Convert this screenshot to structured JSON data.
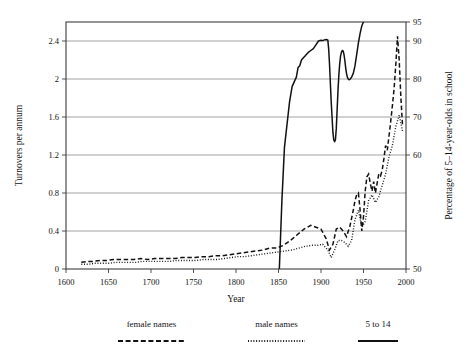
{
  "chart_data": {
    "type": "line",
    "title": "",
    "subtitle": "",
    "xlabel": "Year",
    "ylabel": "Turnovers per annum",
    "y2label": "Percentage of 5–14-year-olds in school",
    "xlim": [
      1600,
      2000
    ],
    "ylim": [
      0,
      2.6
    ],
    "y2lim": [
      50,
      95
    ],
    "xticks": [
      "1600",
      "1650",
      "1700",
      "1750",
      "1800",
      "1850",
      "1900",
      "1950",
      "2000"
    ],
    "xtick_values": [
      1600,
      1650,
      1700,
      1750,
      1800,
      1850,
      1900,
      1950,
      2000
    ],
    "yticks": [
      "0",
      "0.4",
      "0.8",
      "1.2",
      "1.6",
      "2",
      "2.4"
    ],
    "ytick_values": [
      0,
      0.4,
      0.8,
      1.2,
      1.6,
      2,
      2.4
    ],
    "y2ticks": [
      "50",
      "60",
      "70",
      "80",
      "90",
      "95"
    ],
    "y2tick_values": [
      50,
      60,
      70,
      80,
      90,
      95
    ],
    "grid": true,
    "grid_axis": "y",
    "legend_position": "below-outside",
    "legend": [
      "female names",
      "male names",
      "5 to 14"
    ],
    "series": [
      {
        "name": "female names",
        "style": "dashed",
        "axis": "left",
        "x": [
          1618,
          1625,
          1632,
          1640,
          1648,
          1656,
          1664,
          1672,
          1680,
          1688,
          1696,
          1704,
          1712,
          1720,
          1728,
          1736,
          1744,
          1752,
          1760,
          1768,
          1776,
          1784,
          1792,
          1800,
          1808,
          1816,
          1824,
          1832,
          1840,
          1848,
          1856,
          1864,
          1872,
          1880,
          1888,
          1894,
          1900,
          1906,
          1910,
          1914,
          1918,
          1922,
          1926,
          1930,
          1934,
          1938,
          1940,
          1942,
          1944,
          1946,
          1948,
          1950,
          1952,
          1954,
          1956,
          1958,
          1960,
          1962,
          1964,
          1966,
          1968,
          1970,
          1972,
          1974,
          1976,
          1978,
          1980,
          1982,
          1984,
          1986,
          1988,
          1990,
          1992,
          1994,
          1996
        ],
        "y": [
          0.07,
          0.08,
          0.08,
          0.09,
          0.09,
          0.1,
          0.1,
          0.1,
          0.1,
          0.11,
          0.1,
          0.11,
          0.11,
          0.11,
          0.11,
          0.12,
          0.12,
          0.12,
          0.13,
          0.13,
          0.14,
          0.14,
          0.15,
          0.16,
          0.17,
          0.18,
          0.19,
          0.2,
          0.22,
          0.22,
          0.25,
          0.3,
          0.36,
          0.42,
          0.46,
          0.44,
          0.42,
          0.32,
          0.2,
          0.26,
          0.42,
          0.44,
          0.4,
          0.34,
          0.45,
          0.62,
          0.72,
          0.78,
          0.8,
          0.62,
          0.4,
          0.55,
          0.82,
          0.97,
          1.0,
          0.9,
          0.82,
          0.92,
          0.8,
          0.9,
          1.0,
          0.98,
          1.04,
          1.16,
          1.3,
          1.25,
          1.4,
          1.55,
          1.72,
          1.9,
          2.15,
          2.45,
          2.2,
          1.8,
          1.5
        ]
      },
      {
        "name": "male names",
        "style": "dotted",
        "axis": "left",
        "x": [
          1618,
          1626,
          1634,
          1642,
          1650,
          1658,
          1666,
          1674,
          1682,
          1690,
          1698,
          1706,
          1714,
          1722,
          1730,
          1738,
          1746,
          1754,
          1762,
          1770,
          1778,
          1786,
          1794,
          1802,
          1810,
          1818,
          1826,
          1834,
          1842,
          1850,
          1858,
          1866,
          1874,
          1882,
          1890,
          1896,
          1902,
          1908,
          1912,
          1916,
          1920,
          1924,
          1928,
          1932,
          1936,
          1940,
          1944,
          1948,
          1952,
          1956,
          1960,
          1964,
          1968,
          1972,
          1976,
          1980,
          1984,
          1988,
          1992,
          1996
        ],
        "y": [
          0.05,
          0.05,
          0.06,
          0.06,
          0.06,
          0.07,
          0.07,
          0.07,
          0.07,
          0.08,
          0.08,
          0.08,
          0.08,
          0.08,
          0.09,
          0.09,
          0.09,
          0.09,
          0.1,
          0.1,
          0.1,
          0.11,
          0.12,
          0.13,
          0.13,
          0.14,
          0.15,
          0.16,
          0.17,
          0.18,
          0.19,
          0.2,
          0.22,
          0.24,
          0.25,
          0.25,
          0.26,
          0.2,
          0.12,
          0.2,
          0.3,
          0.3,
          0.28,
          0.24,
          0.3,
          0.52,
          0.62,
          0.44,
          0.5,
          0.72,
          0.78,
          0.7,
          0.76,
          0.88,
          1.0,
          1.18,
          1.3,
          1.5,
          1.62,
          1.45
        ]
      },
      {
        "name": "5 to 14",
        "style": "solid",
        "axis": "right",
        "x": [
          1851,
          1854,
          1857,
          1860,
          1863,
          1866,
          1869,
          1871,
          1873,
          1875,
          1877,
          1879,
          1881,
          1883,
          1885,
          1888,
          1891,
          1894,
          1897,
          1900,
          1902,
          1904,
          1906,
          1908,
          1909,
          1910,
          1911,
          1912,
          1913,
          1914,
          1915,
          1916,
          1917,
          1918,
          1919,
          1920,
          1921,
          1922,
          1923,
          1924,
          1925,
          1926,
          1927,
          1928,
          1929,
          1930,
          1931,
          1932,
          1933,
          1934,
          1935,
          1936,
          1938,
          1940,
          1942,
          1944,
          1946,
          1948,
          1950
        ],
        "y": [
          50,
          56,
          62,
          68,
          74,
          78,
          79.5,
          80.5,
          83,
          83.5,
          85,
          85.5,
          86,
          86.5,
          87,
          87.5,
          88,
          89,
          90,
          90.2,
          90.1,
          90.3,
          90.4,
          90.3,
          88,
          84,
          79,
          74,
          70,
          66,
          64,
          63.5,
          64,
          67,
          72,
          77,
          81,
          84,
          86,
          87,
          87.5,
          87.4,
          86.5,
          85,
          83,
          81.5,
          80.5,
          80,
          79.8,
          79.9,
          80.2,
          80.5,
          81.5,
          83.5,
          86.5,
          89.5,
          92,
          94,
          95
        ]
      }
    ]
  },
  "axes": {
    "y_label": "Turnovers per annum",
    "y2_label": "Percentage of 5–14-year-olds in school",
    "x_label": "Year"
  },
  "legend": {
    "items": [
      {
        "label": "female names",
        "style": "dashed"
      },
      {
        "label": "male names",
        "style": "dotted"
      },
      {
        "label": "5 to 14",
        "style": "solid"
      }
    ]
  }
}
